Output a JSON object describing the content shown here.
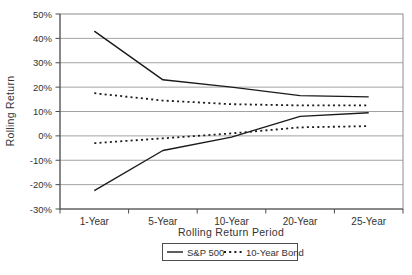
{
  "chart_data": {
    "type": "line",
    "title": "",
    "xlabel": "Rolling Return Period",
    "ylabel": "Rolling Return",
    "categories": [
      "1-Year",
      "5-Year",
      "10-Year",
      "20-Year",
      "25-Year"
    ],
    "ylim": [
      -30,
      50
    ],
    "grid": true,
    "y_ticks": [
      {
        "v": 50,
        "label": "50%"
      },
      {
        "v": 40,
        "label": "40%"
      },
      {
        "v": 30,
        "label": "30%"
      },
      {
        "v": 20,
        "label": "20%"
      },
      {
        "v": 10,
        "label": "10%"
      },
      {
        "v": 0,
        "label": "0%"
      },
      {
        "v": -10,
        "label": "-10%"
      },
      {
        "v": -20,
        "label": "-20%"
      },
      {
        "v": -30,
        "label": "-30%"
      }
    ],
    "series": [
      {
        "id": "sp500-high",
        "name": "S&P 500 (highest)",
        "style": "solid",
        "values": [
          43,
          23,
          20,
          16.5,
          16
        ]
      },
      {
        "id": "sp500-low",
        "name": "S&P 500 (lowest)",
        "style": "solid",
        "values": [
          -22.5,
          -6,
          -0.5,
          8,
          9.5
        ]
      },
      {
        "id": "bond10y-high",
        "name": "10-Year Bond (highest)",
        "style": "dotted",
        "values": [
          17.5,
          14.5,
          13,
          12.5,
          12.5
        ]
      },
      {
        "id": "bond10y-low",
        "name": "10-Year Bond (lowest)",
        "style": "dotted",
        "values": [
          -3,
          -1,
          1,
          3.5,
          4
        ]
      }
    ],
    "legend_position": "bottom",
    "legend": {
      "items": [
        {
          "label": "S&P 500",
          "style": "solid"
        },
        {
          "label": "10-Year Bond",
          "style": "dotted"
        }
      ]
    },
    "colors": {
      "series_line": "#1a1a1a",
      "gridline": "#a3a3a3",
      "plot_border": "#8c8c8c",
      "axis": "#4d4d4d",
      "text": "#333333",
      "background": "#ffffff"
    }
  }
}
